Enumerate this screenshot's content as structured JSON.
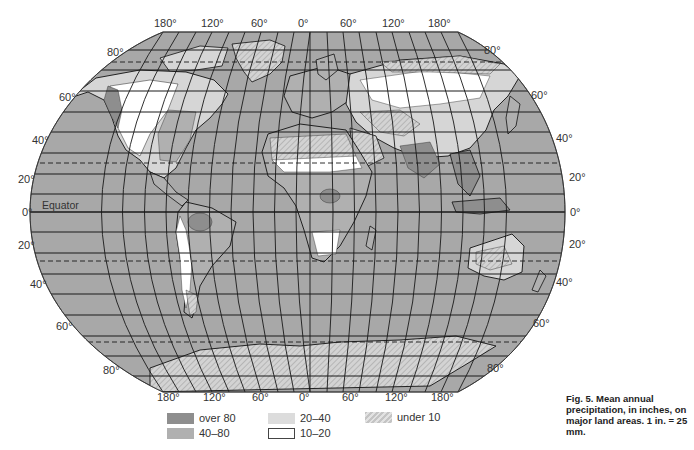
{
  "figure": {
    "caption": "Fig. 5. Mean annual precipitation, in inches, on major land areas. 1 in. = 25 mm."
  },
  "map": {
    "projection": "world map, elliptical graticule",
    "colors": {
      "ocean": "#a8a8a8",
      "over_80": "#8e8e8e",
      "40_80": "#b0b0b0",
      "20_40": "#d6d6d6",
      "10_20": "#ffffff",
      "under_10": "#d0d0d0",
      "grid": "#1a1a1a",
      "coast": "#111111"
    },
    "longitude_labels_top": [
      "180°",
      "120°",
      "60°",
      "0°",
      "60°",
      "120°",
      "180°"
    ],
    "longitude_labels_bottom": [
      "180°",
      "120°",
      "60°",
      "0°",
      "60°",
      "120°",
      "180°"
    ],
    "latitude_labels_left": [
      "80°",
      "60°",
      "40°",
      "20°",
      "0°",
      "20°",
      "40°",
      "60°",
      "80°"
    ],
    "latitude_labels_right": [
      "80°",
      "60°",
      "40°",
      "20°",
      "0°",
      "20°",
      "40°",
      "60°",
      "80°"
    ],
    "equator_label": "Equator"
  },
  "legend": {
    "title": "",
    "items": [
      {
        "label": "over 80",
        "swatch": "over_80"
      },
      {
        "label": "40–80",
        "swatch": "40_80"
      },
      {
        "label": "20–40",
        "swatch": "20_40"
      },
      {
        "label": "10–20",
        "swatch": "10_20"
      },
      {
        "label": "under 10",
        "swatch": "under_10"
      }
    ]
  }
}
